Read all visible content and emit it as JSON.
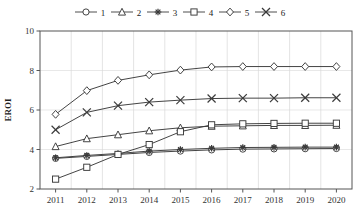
{
  "chart_data": {
    "type": "line",
    "title": "",
    "xlabel": "",
    "ylabel": "EROI",
    "x": [
      2011,
      2012,
      2013,
      2014,
      2015,
      2016,
      2017,
      2018,
      2019,
      2020
    ],
    "xtick_labels": [
      "2011",
      "2012",
      "2013",
      "2014",
      "2015",
      "2016",
      "2017",
      "2018",
      "2019",
      "2020"
    ],
    "ytick_labels": [
      "2",
      "4",
      "6",
      "8",
      "10"
    ],
    "yticks": [
      2,
      4,
      6,
      8,
      10
    ],
    "ylim": [
      2,
      10
    ],
    "grid": true,
    "legend_position": "top",
    "series": [
      {
        "name": "1",
        "marker": "circle",
        "values": [
          3.55,
          3.65,
          3.75,
          3.85,
          3.92,
          3.98,
          4.02,
          4.03,
          4.04,
          4.05
        ]
      },
      {
        "name": "2",
        "marker": "triangle",
        "values": [
          4.15,
          4.55,
          4.75,
          4.95,
          5.1,
          5.18,
          5.2,
          5.22,
          5.22,
          5.23
        ]
      },
      {
        "name": "3",
        "marker": "asterisk",
        "values": [
          3.58,
          3.7,
          3.8,
          3.92,
          4.0,
          4.06,
          4.1,
          4.11,
          4.12,
          4.12
        ]
      },
      {
        "name": "4",
        "marker": "square",
        "values": [
          2.5,
          3.1,
          3.75,
          4.25,
          4.9,
          5.25,
          5.3,
          5.32,
          5.33,
          5.33
        ]
      },
      {
        "name": "5",
        "marker": "diamond",
        "values": [
          5.78,
          6.98,
          7.5,
          7.78,
          8.02,
          8.18,
          8.2,
          8.2,
          8.2,
          8.2
        ]
      },
      {
        "name": "6",
        "marker": "cross",
        "values": [
          5.0,
          5.88,
          6.22,
          6.4,
          6.5,
          6.58,
          6.6,
          6.6,
          6.62,
          6.62
        ]
      }
    ],
    "legend_entries": [
      {
        "label": "1",
        "marker": "circle"
      },
      {
        "label": "2",
        "marker": "triangle"
      },
      {
        "label": "3",
        "marker": "asterisk"
      },
      {
        "label": "4",
        "marker": "square"
      },
      {
        "label": "5",
        "marker": "diamond"
      },
      {
        "label": "6",
        "marker": "cross"
      }
    ],
    "colors": {
      "line": "#3a3a3a",
      "grid": "#d9d9d9",
      "axis": "#555555",
      "background": "#ffffff"
    }
  }
}
